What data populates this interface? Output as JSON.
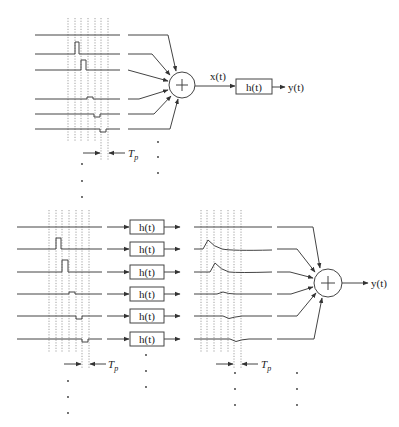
{
  "top": {
    "input_label": "x(t)",
    "filter_label": "h(t)",
    "output_label": "y(t)",
    "period_label": "T",
    "period_sub": "p",
    "summer_symbol": "+"
  },
  "bottom": {
    "filter_labels": [
      "h(t)",
      "h(t)",
      "h(t)",
      "h(t)",
      "h(t)",
      "h(t)"
    ],
    "output_label": "y(t)",
    "period_label": "T",
    "period_sub": "p",
    "summer_symbol": "+"
  }
}
